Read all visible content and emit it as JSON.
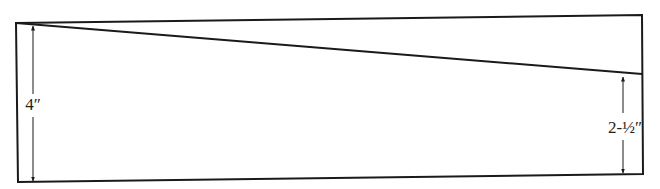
{
  "diagram": {
    "type": "cut-layout",
    "colors": {
      "line": "#1a1a1a",
      "background": "#ffffff"
    },
    "outline": {
      "top_left": [
        16,
        23
      ],
      "top_right": [
        642,
        15
      ],
      "bottom_right": [
        643,
        174
      ],
      "bottom_left": [
        18,
        182
      ]
    },
    "cut_line": {
      "from": [
        16,
        23
      ],
      "to": [
        642,
        74
      ]
    },
    "dimensions": [
      {
        "id": "left",
        "label": "4″",
        "x": 33,
        "y_top": 25,
        "y_bottom": 181,
        "label_y": 110
      },
      {
        "id": "right",
        "label": "2-½″",
        "x": 623,
        "y_top": 76,
        "y_bottom": 173,
        "label_y": 133
      }
    ]
  }
}
